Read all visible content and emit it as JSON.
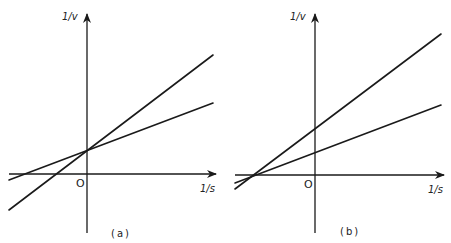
{
  "diagram": {
    "type": "lineweaver-burk-plots",
    "panels": [
      {
        "caption": "(a)",
        "y_axis_label": "1/v",
        "x_axis_label": "1/s",
        "origin_label": "O",
        "description": "Two lines intersecting on the 1/v axis (common y-intercept, different slopes)",
        "lines": [
          {
            "name": "steep",
            "from": [
              9,
              210
            ],
            "to": [
              213,
              55
            ]
          },
          {
            "name": "shallow",
            "from": [
              9,
              180
            ],
            "to": [
              213,
              103
            ]
          }
        ],
        "intersection": [
          87,
          151
        ]
      },
      {
        "caption": "(b)",
        "y_axis_label": "1/v",
        "x_axis_label": "1/s",
        "origin_label": "O",
        "description": "Two lines intersecting on the 1/s axis (common x-intercept, different y-intercepts)",
        "lines": [
          {
            "name": "steep",
            "from": [
              235,
              189
            ],
            "to": [
              441,
              34
            ]
          },
          {
            "name": "shallow",
            "from": [
              235,
              183
            ],
            "to": [
              441,
              105
            ]
          }
        ],
        "intersection": [
          253,
          175
        ]
      }
    ]
  },
  "colors": {
    "ink": "#1a1a1a",
    "background": "#ffffff"
  }
}
